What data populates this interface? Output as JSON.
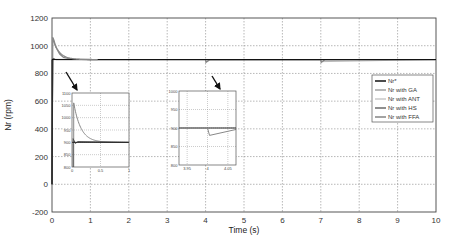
{
  "chart_data": {
    "type": "line",
    "title": "",
    "xlabel": "Time (s)",
    "ylabel": "Nr (rpm)",
    "xlim": [
      0,
      10
    ],
    "ylim": [
      -200,
      1200
    ],
    "xticks": [
      "0",
      "1",
      "2",
      "3",
      "4",
      "5",
      "6",
      "7",
      "8",
      "9",
      "10"
    ],
    "yticks": [
      "1200",
      "1000",
      "800",
      "600",
      "400",
      "200",
      "0",
      "-200"
    ],
    "grid": true,
    "legend_position": "right-middle",
    "legend": [
      "Nr*",
      "Nr with GA",
      "Nr with ANT",
      "Nr with HS",
      "Nr with FFA"
    ],
    "series": [
      {
        "name": "Nr*",
        "x": [
          0,
          0,
          10
        ],
        "y": [
          0,
          900,
          900
        ],
        "color": "#111111"
      },
      {
        "name": "Nr with GA",
        "x": [
          0,
          0.02,
          0.05,
          0.1,
          0.2,
          0.3,
          0.5,
          1,
          4,
          4.01,
          4.1,
          7,
          7.01,
          7.1,
          10
        ],
        "y": [
          0,
          1060,
          1040,
          990,
          940,
          915,
          903,
          900,
          900,
          880,
          898,
          900,
          880,
          898,
          900
        ],
        "color": "#888888"
      },
      {
        "name": "Nr with ANT",
        "x": [
          0,
          0.02,
          0.1,
          1,
          4,
          4.01,
          4.1,
          7,
          7.01,
          10
        ],
        "y": [
          0,
          910,
          902,
          900,
          900,
          885,
          898,
          900,
          885,
          900
        ],
        "color": "#bbbbbb"
      },
      {
        "name": "Nr with HS",
        "x": [
          0,
          0.02,
          0.1,
          1,
          10
        ],
        "y": [
          0,
          905,
          900,
          900,
          900
        ],
        "color": "#444444"
      },
      {
        "name": "Nr with FFA",
        "x": [
          0,
          0.02,
          0.1,
          1,
          10
        ],
        "y": [
          0,
          905,
          900,
          900,
          900
        ],
        "color": "#666666"
      }
    ],
    "insets": [
      {
        "xlim": [
          0,
          1
        ],
        "ylim": [
          800,
          1100
        ],
        "xticks": [
          "0",
          "0.5",
          "1"
        ],
        "yticks": [
          "1100",
          "1050",
          "1000",
          "950",
          "900",
          "850",
          "800"
        ],
        "zooms_on": "startup transient t=0"
      },
      {
        "xlim": [
          3.93,
          4.07
        ],
        "ylim": [
          800,
          1000
        ],
        "xticks": [
          "3.95",
          "4",
          "4.05"
        ],
        "yticks": [
          "1000",
          "950",
          "900",
          "850",
          "800"
        ],
        "zooms_on": "disturbance at t=4"
      }
    ]
  },
  "axis": {
    "xlabel": "Time (s)",
    "ylabel": "Nr (rpm)"
  },
  "legend": {
    "items": [
      "Nr*",
      "Nr with GA",
      "Nr with ANT",
      "Nr with HS",
      "Nr with FFA"
    ]
  }
}
